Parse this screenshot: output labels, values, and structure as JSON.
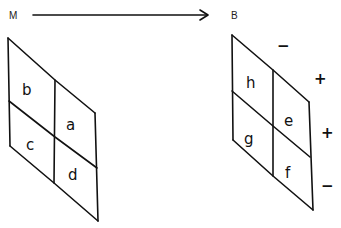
{
  "header": {
    "start_label": "M",
    "end_label": "B"
  },
  "left_panel": {
    "cells": {
      "top_left": "b",
      "bottom_left": "c",
      "top_right": "a",
      "bottom_right": "d"
    }
  },
  "right_panel": {
    "cells": {
      "top_left": "h",
      "bottom_left": "g",
      "top_right": "e",
      "bottom_right": "f"
    },
    "signs": {
      "top_edge": "−",
      "right_upper": "+",
      "right_middle": "+",
      "right_lower": "−"
    }
  },
  "colors": {
    "ink": "#111111",
    "background": "#ffffff"
  }
}
